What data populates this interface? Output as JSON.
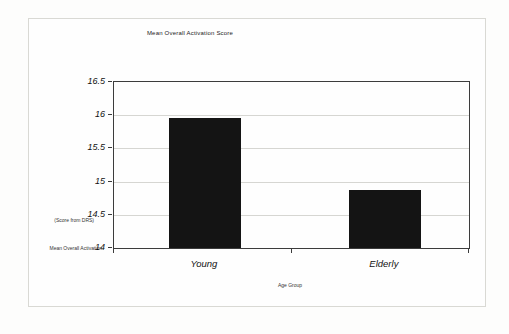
{
  "figure": {
    "kind": "scanned bar chart figure"
  },
  "chart_data": {
    "type": "bar",
    "title": "Mean Overall Activation Score",
    "categories": [
      "Young",
      "Elderly"
    ],
    "values": [
      15.96,
      14.87
    ],
    "xlabel": "Age Group",
    "ylabel": "Mean Overall Activation (Score from DRS)",
    "ylabel_lines": [
      "(Score from DRS)",
      "Mean Overall Activation"
    ],
    "ylim": [
      14,
      16.5
    ],
    "yticks": [
      14,
      14.5,
      15,
      15.5,
      16,
      16.5
    ],
    "ytick_step": 0.5,
    "grid": true,
    "legend": "none",
    "bar_color": "#141414",
    "axis_color": "#3c3c3c",
    "gridline_color": "#d6d6d2",
    "frame_color": "#d9d9d4"
  }
}
